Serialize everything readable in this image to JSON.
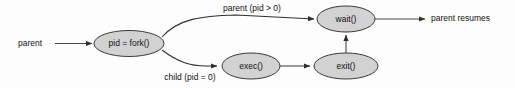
{
  "diagram": {
    "colors": {
      "node_fill": "#d2d2d2",
      "node_stroke": "#3a3a3a",
      "edge": "#4a4a4a",
      "text": "#111111",
      "background": "#fdfdfd"
    },
    "nodes": [
      {
        "id": "fork",
        "label": "pid = fork()",
        "cx": 129,
        "cy": 43.5,
        "rx": 35,
        "ry": 13
      },
      {
        "id": "wait",
        "label": "wait()",
        "cx": 346,
        "cy": 19,
        "rx": 29,
        "ry": 13
      },
      {
        "id": "exec",
        "label": "exec()",
        "cx": 251,
        "cy": 66,
        "rx": 29,
        "ry": 13
      },
      {
        "id": "exit",
        "label": "exit()",
        "cx": 346,
        "cy": 66,
        "rx": 32,
        "ry": 13
      }
    ],
    "terminals": [
      {
        "id": "parent-start",
        "label": "parent",
        "x": 18,
        "y": 43.5
      },
      {
        "id": "parent-resumes",
        "label": "parent resumes",
        "x": 431,
        "y": 19
      }
    ],
    "edge_labels": [
      {
        "id": "parent-branch",
        "label": "parent (pid > 0)",
        "x": 252,
        "y": 9
      },
      {
        "id": "child-branch",
        "label": "child (pid = 0)",
        "x": 190,
        "y": 78
      }
    ]
  }
}
